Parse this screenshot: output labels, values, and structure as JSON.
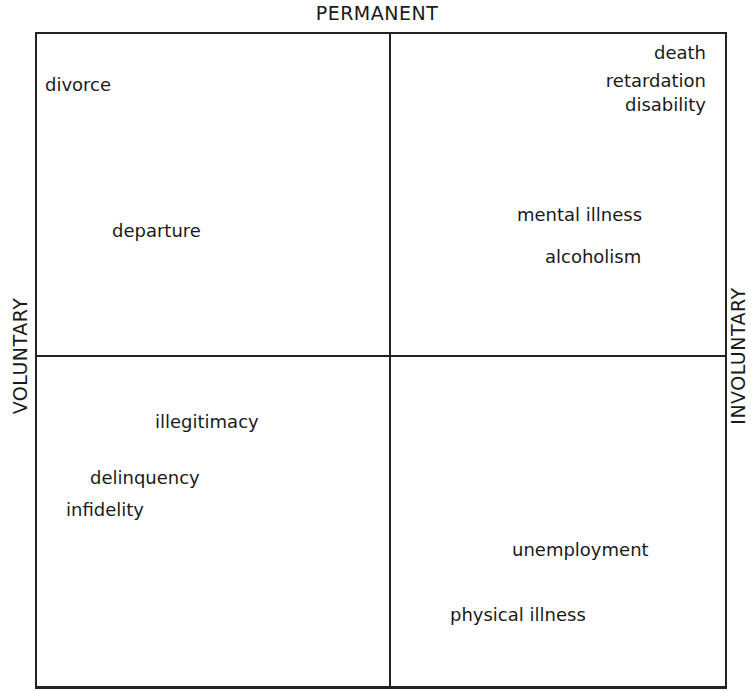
{
  "axes": {
    "top": "PERMANENT",
    "left": "VOLUNTARY",
    "right": "INVOLUNTARY"
  },
  "quadrants": {
    "permanent_voluntary": [
      "divorce",
      "departure"
    ],
    "permanent_involuntary": [
      "death",
      "retardation",
      "disability",
      "mental illness",
      "alcoholism"
    ],
    "temporary_voluntary": [
      "illegitimacy",
      "delinquency",
      "infidelity"
    ],
    "temporary_involuntary": [
      "unemployment",
      "physical illness"
    ]
  },
  "colors": {
    "line": "#222222",
    "text": "#1a1a1a",
    "background": "#ffffff"
  }
}
